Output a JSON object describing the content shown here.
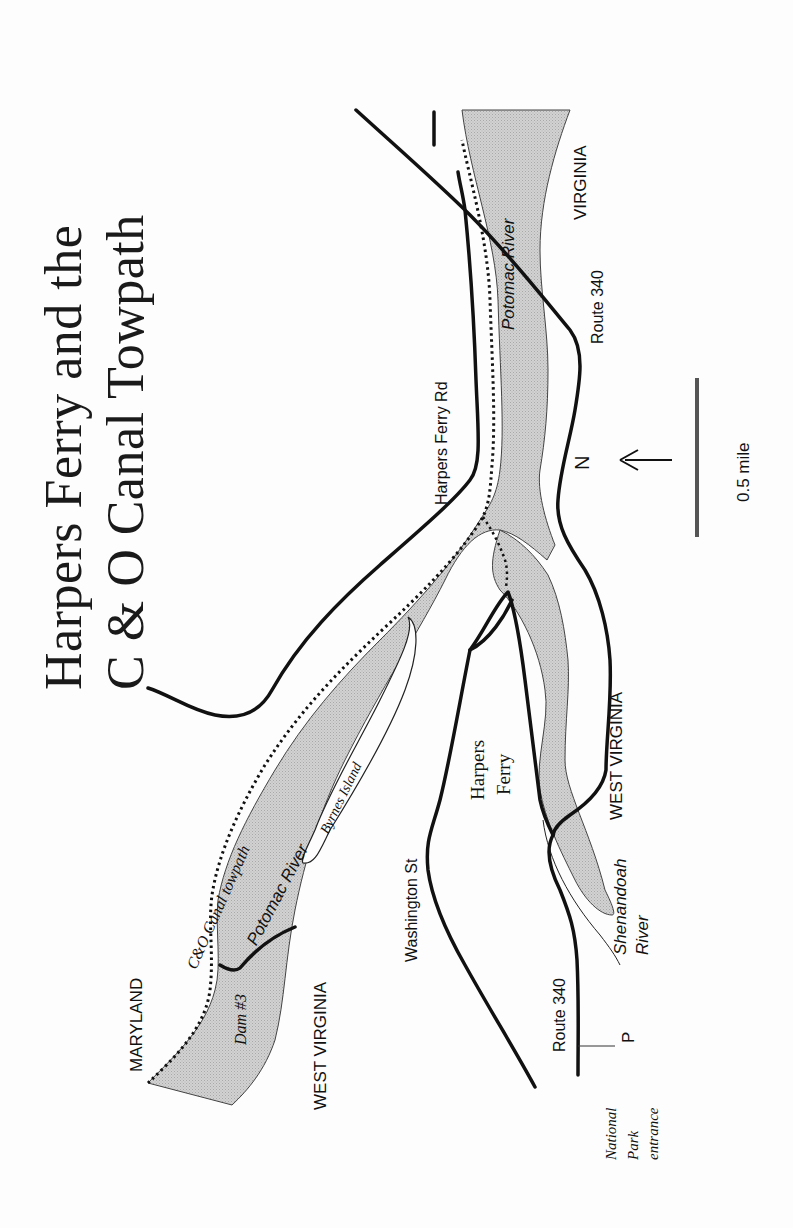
{
  "title": {
    "line1": "Harpers Ferry and the",
    "line2": "C & O Canal Towpath"
  },
  "colors": {
    "background": "#fdfdfd",
    "water": "#c9c9c9",
    "road": "#111111",
    "towpath": "#111111",
    "text": "#111111"
  },
  "labels": {
    "maryland": "MARYLAND",
    "west_virginia_north": "WEST VIRGINIA",
    "west_virginia_south": "WEST VIRGINIA",
    "virginia": "VIRGINIA",
    "canal_towpath": "C&O  Canal towpath",
    "potomac_river_west": "Potomac River",
    "potomac_river_east": "Potomac River",
    "dam": "Dam #3",
    "island": "Byrnes Island",
    "washington_st": "Washington St",
    "harpers_ferry_town_line1": "Harpers",
    "harpers_ferry_town_line2": "Ferry",
    "harpers_ferry_rd": "Harpers Ferry Rd",
    "route_340_south": "Route 340",
    "route_340_north": "Route 340",
    "shenandoah_line1": "Shenandoah",
    "shenandoah_line2": "River",
    "parking": "P",
    "park_entrance_line1": "National",
    "park_entrance_line2": "Park",
    "park_entrance_line3": "entrance"
  },
  "north_arrow": {
    "label": "N",
    "icon": "arrow-up-north"
  },
  "scale_bar": {
    "label": "0.5 mile"
  }
}
